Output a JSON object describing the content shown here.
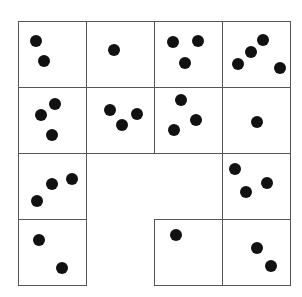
{
  "diagram": {
    "title": "",
    "grid": {
      "rows": 4,
      "cols": 4,
      "origin_x": 18,
      "origin_y": 21,
      "cell_w": 68,
      "cell_h": 66
    },
    "line_color": "#555555",
    "dot_color": "#111111",
    "cells": [
      {
        "row": 0,
        "col": 0,
        "count": 2,
        "dots": [
          [
            36,
            41
          ],
          [
            44,
            61
          ]
        ]
      },
      {
        "row": 0,
        "col": 1,
        "count": 1,
        "dots": [
          [
            114,
            50
          ]
        ]
      },
      {
        "row": 0,
        "col": 2,
        "count": 3,
        "dots": [
          [
            173,
            42
          ],
          [
            198,
            41
          ],
          [
            185,
            63
          ]
        ]
      },
      {
        "row": 0,
        "col": 3,
        "count": 4,
        "dots": [
          [
            263,
            40
          ],
          [
            251,
            52
          ],
          [
            238,
            64
          ],
          [
            280,
            68
          ]
        ]
      },
      {
        "row": 1,
        "col": 0,
        "count": 3,
        "dots": [
          [
            55,
            104
          ],
          [
            41,
            115
          ],
          [
            52,
            135
          ]
        ]
      },
      {
        "row": 1,
        "col": 1,
        "count": 3,
        "dots": [
          [
            110,
            110
          ],
          [
            122,
            125
          ],
          [
            137,
            114
          ]
        ]
      },
      {
        "row": 1,
        "col": 2,
        "count": 3,
        "dots": [
          [
            181,
            100
          ],
          [
            196,
            120
          ],
          [
            174,
            130
          ]
        ]
      },
      {
        "row": 1,
        "col": 3,
        "count": 1,
        "dots": [
          [
            257,
            122
          ]
        ]
      },
      {
        "row": 2,
        "col": 0,
        "count": 3,
        "dots": [
          [
            72,
            179
          ],
          [
            52,
            184
          ],
          [
            37,
            201
          ]
        ]
      },
      {
        "row": 2,
        "col": 3,
        "count": 3,
        "dots": [
          [
            235,
            169
          ],
          [
            267,
            183
          ],
          [
            246,
            192
          ]
        ]
      },
      {
        "row": 3,
        "col": 0,
        "count": 2,
        "dots": [
          [
            39,
            240
          ],
          [
            62,
            268
          ]
        ]
      },
      {
        "row": 3,
        "col": 2,
        "count": 1,
        "dots": [
          [
            176,
            235
          ]
        ]
      },
      {
        "row": 3,
        "col": 3,
        "count": 2,
        "dots": [
          [
            257,
            248
          ],
          [
            271,
            266
          ]
        ]
      }
    ],
    "missing_cells": [
      [
        2,
        1
      ],
      [
        2,
        2
      ],
      [
        3,
        1
      ]
    ]
  }
}
